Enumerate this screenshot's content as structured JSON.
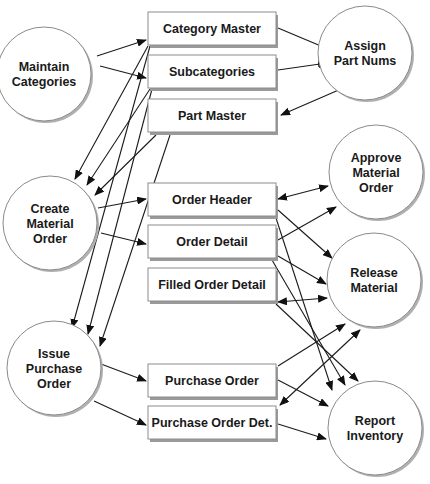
{
  "diagram": {
    "type": "data-flow-diagram",
    "processes": [
      {
        "id": "maintain",
        "lines": [
          "Maintain",
          "Categories"
        ],
        "cx": 44,
        "cy": 74,
        "r": 47
      },
      {
        "id": "assign",
        "lines": [
          "Assign",
          "Part Nums"
        ],
        "cx": 365,
        "cy": 53,
        "r": 47
      },
      {
        "id": "create",
        "lines": [
          "Create",
          "Material",
          "Order"
        ],
        "cx": 50,
        "cy": 223,
        "r": 47
      },
      {
        "id": "approve",
        "lines": [
          "Approve",
          "Material",
          "Order"
        ],
        "cx": 376,
        "cy": 172,
        "r": 47
      },
      {
        "id": "release",
        "lines": [
          "Release",
          "Material"
        ],
        "cx": 374,
        "cy": 280,
        "r": 47
      },
      {
        "id": "issue",
        "lines": [
          "Issue",
          "Purchase",
          "Order"
        ],
        "cx": 54,
        "cy": 368,
        "r": 47
      },
      {
        "id": "report",
        "lines": [
          "Report",
          "Inventory"
        ],
        "cx": 375,
        "cy": 428,
        "r": 47
      }
    ],
    "datastores": [
      {
        "id": "cat_master",
        "label": "Category Master",
        "x": 148,
        "y": 12,
        "w": 128,
        "h": 33
      },
      {
        "id": "subcat",
        "label": "Subcategories",
        "x": 148,
        "y": 55,
        "w": 128,
        "h": 33
      },
      {
        "id": "part_master",
        "label": "Part Master",
        "x": 148,
        "y": 99,
        "w": 128,
        "h": 33
      },
      {
        "id": "order_header",
        "label": "Order Header",
        "x": 148,
        "y": 183,
        "w": 128,
        "h": 33
      },
      {
        "id": "order_detail",
        "label": "Order Detail",
        "x": 148,
        "y": 225,
        "w": 128,
        "h": 33
      },
      {
        "id": "filled_detail",
        "label": "Filled Order Detail",
        "x": 148,
        "y": 268,
        "w": 128,
        "h": 33
      },
      {
        "id": "po",
        "label": "Purchase Order",
        "x": 148,
        "y": 364,
        "w": 128,
        "h": 33
      },
      {
        "id": "po_det",
        "label": "Purchase Order Det.",
        "x": 148,
        "y": 406,
        "w": 128,
        "h": 33
      }
    ],
    "flows": [
      {
        "from": "maintain",
        "to": "cat_master",
        "x1": 97,
        "y1": 56,
        "x2": 146,
        "y2": 40,
        "head_start": false,
        "head_end": true
      },
      {
        "from": "maintain",
        "to": "subcat",
        "x1": 100,
        "y1": 66,
        "x2": 146,
        "y2": 78,
        "head_start": false,
        "head_end": true
      },
      {
        "from": "cat_master",
        "to": "assign",
        "x1": 278,
        "y1": 28,
        "x2": 328,
        "y2": 49,
        "head_start": false,
        "head_end": true
      },
      {
        "from": "subcat",
        "to": "assign",
        "x1": 278,
        "y1": 70,
        "x2": 327,
        "y2": 63,
        "head_start": false,
        "head_end": true
      },
      {
        "from": "assign",
        "to": "part_master",
        "x1": 341,
        "y1": 89,
        "x2": 281,
        "y2": 115,
        "head_start": false,
        "head_end": true
      },
      {
        "from": "cat_master",
        "to": "create",
        "x1": 148,
        "y1": 46,
        "x2": 75,
        "y2": 179,
        "head_start": false,
        "head_end": true
      },
      {
        "from": "subcat",
        "to": "create",
        "x1": 150,
        "y1": 89,
        "x2": 87,
        "y2": 185,
        "head_start": false,
        "head_end": true
      },
      {
        "from": "part_master",
        "to": "create",
        "x1": 156,
        "y1": 135,
        "x2": 95,
        "y2": 195,
        "head_start": false,
        "head_end": true
      },
      {
        "from": "create",
        "to": "order_header",
        "x1": 98,
        "y1": 208,
        "x2": 146,
        "y2": 199,
        "head_start": false,
        "head_end": true
      },
      {
        "from": "create",
        "to": "order_detail",
        "x1": 101,
        "y1": 233,
        "x2": 146,
        "y2": 244,
        "head_start": false,
        "head_end": true
      },
      {
        "from": "cat_master",
        "to": "issue",
        "x1": 150,
        "y1": 46,
        "x2": 72,
        "y2": 328,
        "head_start": false,
        "head_end": true
      },
      {
        "from": "subcat",
        "to": "issue",
        "x1": 152,
        "y1": 89,
        "x2": 88,
        "y2": 334,
        "head_start": false,
        "head_end": true
      },
      {
        "from": "part_master",
        "to": "issue",
        "x1": 170,
        "y1": 135,
        "x2": 100,
        "y2": 346,
        "head_start": false,
        "head_end": true
      },
      {
        "from": "issue",
        "to": "po",
        "x1": 101,
        "y1": 364,
        "x2": 146,
        "y2": 381,
        "head_start": false,
        "head_end": true
      },
      {
        "from": "issue",
        "to": "po_det",
        "x1": 94,
        "y1": 401,
        "x2": 146,
        "y2": 425,
        "head_start": false,
        "head_end": true
      },
      {
        "from": "order_header",
        "to": "approve",
        "x1": 278,
        "y1": 199,
        "x2": 328,
        "y2": 186,
        "head_start": true,
        "head_end": true
      },
      {
        "from": "order_detail",
        "to": "approve",
        "x1": 278,
        "y1": 240,
        "x2": 336,
        "y2": 207,
        "head_start": false,
        "head_end": true
      },
      {
        "from": "order_header",
        "to": "release",
        "x1": 278,
        "y1": 210,
        "x2": 332,
        "y2": 258,
        "head_start": false,
        "head_end": true
      },
      {
        "from": "order_detail",
        "to": "release",
        "x1": 278,
        "y1": 256,
        "x2": 326,
        "y2": 284,
        "head_start": false,
        "head_end": true
      },
      {
        "from": "filled_detail",
        "to": "release",
        "x1": 278,
        "y1": 302,
        "x2": 327,
        "y2": 298,
        "head_start": true,
        "head_end": true
      },
      {
        "from": "order_header",
        "to": "report",
        "x1": 276,
        "y1": 218,
        "x2": 332,
        "y2": 390,
        "head_start": false,
        "head_end": true
      },
      {
        "from": "order_detail",
        "to": "report",
        "x1": 272,
        "y1": 260,
        "x2": 345,
        "y2": 385,
        "head_start": false,
        "head_end": true
      },
      {
        "from": "filled_detail",
        "to": "report",
        "x1": 276,
        "y1": 304,
        "x2": 358,
        "y2": 381,
        "head_start": false,
        "head_end": true
      },
      {
        "from": "po",
        "to": "release",
        "x1": 278,
        "y1": 366,
        "x2": 345,
        "y2": 324,
        "head_start": false,
        "head_end": true
      },
      {
        "from": "po_det",
        "to": "release",
        "x1": 280,
        "y1": 405,
        "x2": 360,
        "y2": 330,
        "head_start": true,
        "head_end": true
      },
      {
        "from": "po",
        "to": "report",
        "x1": 278,
        "y1": 380,
        "x2": 328,
        "y2": 406,
        "head_start": false,
        "head_end": true
      },
      {
        "from": "po_det",
        "to": "report",
        "x1": 278,
        "y1": 424,
        "x2": 326,
        "y2": 439,
        "head_start": false,
        "head_end": true
      }
    ]
  }
}
